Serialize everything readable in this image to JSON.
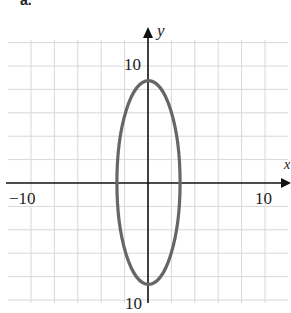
{
  "panel_label": "a.",
  "chart_data": {
    "type": "line",
    "title": "",
    "curve": {
      "shape": "ellipse",
      "center": [
        0,
        0
      ],
      "semi_axis_x": 2.7,
      "semi_axis_y": 8.7,
      "color": "#666666"
    },
    "xlabel": "x",
    "ylabel": "y",
    "xlim": [
      -12,
      12
    ],
    "ylim": [
      -10,
      12
    ],
    "grid": true,
    "grid_step": 2,
    "x_tick_labels": [
      {
        "value": -10,
        "label": "−10"
      },
      {
        "value": 10,
        "label": "10"
      }
    ],
    "y_tick_labels": [
      {
        "value": 10,
        "label": "10"
      },
      {
        "value": -10,
        "label": "−10"
      }
    ],
    "colors": {
      "grid": "#d8d8d8",
      "axis": "#111111",
      "curve": "#666666"
    }
  },
  "labels": {
    "x_neg": "−10",
    "x_pos": "10",
    "y_pos": "10",
    "y_neg": "10",
    "x_axis": "x",
    "y_axis": "y"
  }
}
